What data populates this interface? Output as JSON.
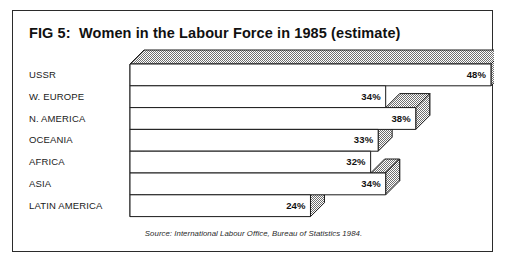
{
  "figure": {
    "title": "FIG 5:  Women in the Labour Force in 1985 (estimate)",
    "source": "Source: International Labour Office, Bureau of Statistics 1984.",
    "border_color": "#2b2b2b",
    "bar_fill": "#ffffff",
    "bar_stroke": "#1a1a1a",
    "shade_color": "#8c8c8c"
  },
  "chart_data": {
    "type": "bar",
    "orientation": "horizontal",
    "style": "3d-isometric",
    "title": "FIG 5:  Women in the Labour Force in 1985 (estimate)",
    "xlabel": "",
    "ylabel": "",
    "unit": "%",
    "xlim": [
      0,
      48
    ],
    "grid": false,
    "legend": false,
    "categories": [
      "USSR",
      "W. EUROPE",
      "N. AMERICA",
      "OCEANIA",
      "AFRICA",
      "ASIA",
      "LATIN AMERICA"
    ],
    "values": [
      48,
      34,
      38,
      33,
      32,
      34,
      24
    ],
    "data_labels": [
      "48%",
      "34%",
      "38%",
      "33%",
      "32%",
      "34%",
      "24%"
    ],
    "annotations": [
      "Source: International Labour Office, Bureau of Statistics 1984."
    ]
  }
}
